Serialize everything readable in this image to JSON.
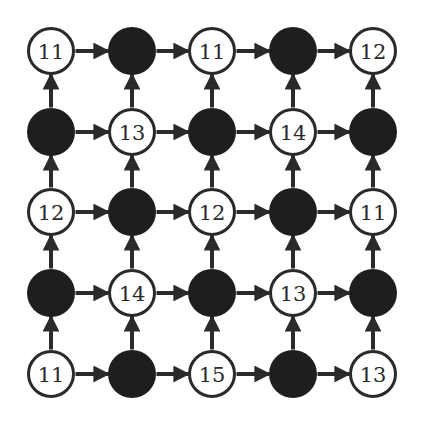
{
  "grid": {
    "rows": 5,
    "cols": 5,
    "colors": {
      "filled": "#1e1e1e",
      "stroke": "#2a2a2a",
      "empty_fill": "#ffffff",
      "arrow": "#2a2a2a"
    },
    "arrow_direction": {
      "horizontal": "right",
      "vertical": "up"
    },
    "nodes": [
      [
        {
          "type": "empty",
          "label": "11"
        },
        {
          "type": "filled",
          "label": ""
        },
        {
          "type": "empty",
          "label": "11"
        },
        {
          "type": "filled",
          "label": ""
        },
        {
          "type": "empty",
          "label": "12"
        }
      ],
      [
        {
          "type": "filled",
          "label": ""
        },
        {
          "type": "empty",
          "label": "13"
        },
        {
          "type": "filled",
          "label": ""
        },
        {
          "type": "empty",
          "label": "14"
        },
        {
          "type": "filled",
          "label": ""
        }
      ],
      [
        {
          "type": "empty",
          "label": "12"
        },
        {
          "type": "filled",
          "label": ""
        },
        {
          "type": "empty",
          "label": "12"
        },
        {
          "type": "filled",
          "label": ""
        },
        {
          "type": "empty",
          "label": "11"
        }
      ],
      [
        {
          "type": "filled",
          "label": ""
        },
        {
          "type": "empty",
          "label": "14"
        },
        {
          "type": "filled",
          "label": ""
        },
        {
          "type": "empty",
          "label": "13"
        },
        {
          "type": "filled",
          "label": ""
        }
      ],
      [
        {
          "type": "empty",
          "label": "11"
        },
        {
          "type": "filled",
          "label": ""
        },
        {
          "type": "empty",
          "label": "15"
        },
        {
          "type": "filled",
          "label": ""
        },
        {
          "type": "empty",
          "label": "13"
        }
      ]
    ]
  }
}
